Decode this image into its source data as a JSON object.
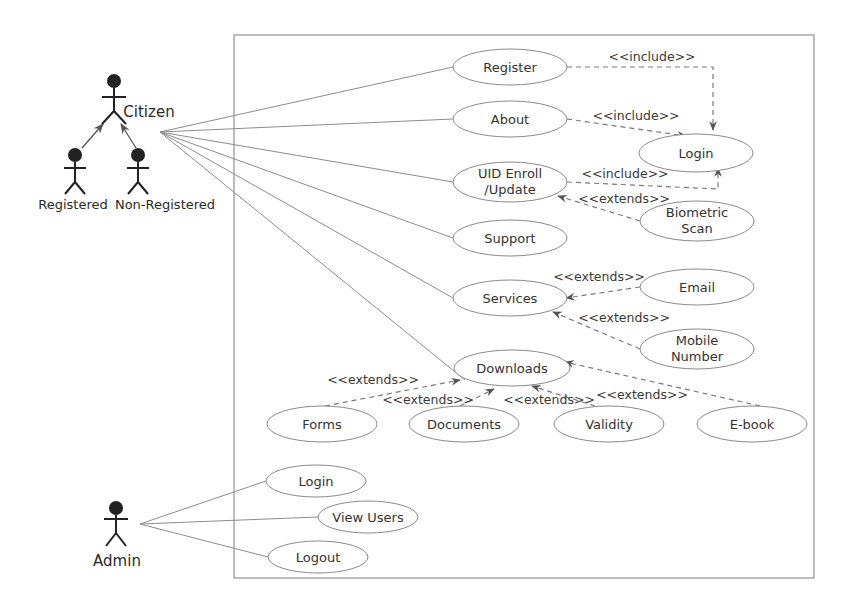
{
  "diagram": {
    "type": "UML use case diagram",
    "actors": {
      "citizen": "Citizen",
      "registered": "Registered",
      "non_registered": "Non-Registered",
      "admin": "Admin"
    },
    "use_cases": {
      "register": "Register",
      "about": "About",
      "uid_line1": "UID Enroll",
      "uid_line2": "/Update",
      "support": "Support",
      "services": "Services",
      "downloads": "Downloads",
      "login": "Login",
      "biometric_line1": "Biometric",
      "biometric_line2": "Scan",
      "email": "Email",
      "mobile_line1": "Mobile",
      "mobile_line2": "Number",
      "forms": "Forms",
      "documents": "Documents",
      "validity": "Validity",
      "ebook": "E-book",
      "admin_login": "Login",
      "view_users": "View Users",
      "logout": "Logout"
    },
    "stereotypes": {
      "register_login": "<<include>>",
      "about_login": "<<include>>",
      "uid_login": "<<include>>",
      "biometric_uid": "<<extends>>",
      "email_services": "<<extends>>",
      "mobile_services": "<<extends>>",
      "forms_downloads": "<<extends>>",
      "documents_downloads": "<<extends>>",
      "validity_downloads": "<<extends>>",
      "ebook_downloads": "<<extends>>"
    },
    "relationships": [
      {
        "from": "Citizen",
        "to": "Register",
        "kind": "association"
      },
      {
        "from": "Citizen",
        "to": "About",
        "kind": "association"
      },
      {
        "from": "Citizen",
        "to": "UID Enroll /Update",
        "kind": "association"
      },
      {
        "from": "Citizen",
        "to": "Support",
        "kind": "association"
      },
      {
        "from": "Citizen",
        "to": "Services",
        "kind": "association"
      },
      {
        "from": "Citizen",
        "to": "Downloads",
        "kind": "association"
      },
      {
        "from": "Registered",
        "to": "Citizen",
        "kind": "generalization"
      },
      {
        "from": "Non-Registered",
        "to": "Citizen",
        "kind": "generalization"
      },
      {
        "from": "Register",
        "to": "Login",
        "kind": "include"
      },
      {
        "from": "About",
        "to": "Login",
        "kind": "include"
      },
      {
        "from": "UID Enroll /Update",
        "to": "Login",
        "kind": "include"
      },
      {
        "from": "Biometric Scan",
        "to": "UID Enroll /Update",
        "kind": "extends"
      },
      {
        "from": "Email",
        "to": "Services",
        "kind": "extends"
      },
      {
        "from": "Mobile Number",
        "to": "Services",
        "kind": "extends"
      },
      {
        "from": "Forms",
        "to": "Downloads",
        "kind": "extends"
      },
      {
        "from": "Documents",
        "to": "Downloads",
        "kind": "extends"
      },
      {
        "from": "Validity",
        "to": "Downloads",
        "kind": "extends"
      },
      {
        "from": "E-book",
        "to": "Downloads",
        "kind": "extends"
      },
      {
        "from": "Admin",
        "to": "Login",
        "kind": "association"
      },
      {
        "from": "Admin",
        "to": "View Users",
        "kind": "association"
      },
      {
        "from": "Admin",
        "to": "Logout",
        "kind": "association"
      }
    ]
  }
}
